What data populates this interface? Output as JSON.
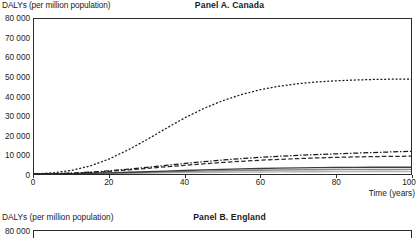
{
  "figure": {
    "axis_color": "#2b2b2b",
    "background": "#ffffff"
  },
  "panel_a": {
    "title": "Panel A. Canada",
    "y_axis_label": "DALYs (per million population)",
    "x_axis_label": "Time (years)"
  },
  "panel_b": {
    "title": "Panel B. England",
    "y_axis_label": "DALYs (per million population)",
    "y_top_tick": "80 000"
  },
  "chart_data": [
    {
      "type": "line",
      "title": "Panel A. Canada",
      "xlabel": "Time (years)",
      "ylabel": "DALYs (per million population)",
      "xlim": [
        0,
        100
      ],
      "ylim": [
        0,
        80000
      ],
      "xticks": [
        0,
        20,
        40,
        60,
        80,
        100
      ],
      "xtick_labels": [
        "0",
        "20",
        "40",
        "60",
        "80",
        "100"
      ],
      "yticks": [
        0,
        10000,
        20000,
        30000,
        40000,
        50000,
        60000,
        70000,
        80000
      ],
      "ytick_labels": [
        "0",
        "10 000",
        "20 000",
        "30 000",
        "40 000",
        "50 000",
        "60 000",
        "70 000",
        "80 000"
      ],
      "grid": false,
      "legend": "none",
      "x": [
        0,
        5,
        10,
        15,
        20,
        25,
        30,
        35,
        40,
        45,
        50,
        55,
        60,
        65,
        70,
        75,
        80,
        85,
        90,
        95,
        100
      ],
      "series": [
        {
          "name": "series-1",
          "style": "dotted",
          "color": "#1a1a1a",
          "values": [
            0,
            600,
            1900,
            4200,
            7800,
            12500,
            17800,
            23500,
            29000,
            33800,
            37800,
            41000,
            43500,
            45300,
            46600,
            47500,
            48100,
            48500,
            48800,
            48950,
            49000
          ]
        },
        {
          "name": "series-2",
          "style": "dash-dot",
          "color": "#1a1a1a",
          "values": [
            0,
            150,
            450,
            950,
            1650,
            2500,
            3450,
            4450,
            5450,
            6350,
            7200,
            7950,
            8600,
            9150,
            9650,
            10050,
            10400,
            10750,
            11050,
            11400,
            11700
          ]
        },
        {
          "name": "series-3",
          "style": "dashed",
          "color": "#2b2b2b",
          "values": [
            0,
            120,
            380,
            800,
            1400,
            2100,
            2900,
            3700,
            4500,
            5250,
            5950,
            6550,
            7100,
            7550,
            7950,
            8300,
            8600,
            8800,
            8980,
            9100,
            9200
          ]
        },
        {
          "name": "series-4",
          "style": "solid",
          "color": "#3c3c3c",
          "values": [
            0,
            60,
            180,
            360,
            600,
            880,
            1180,
            1500,
            1820,
            2120,
            2400,
            2650,
            2860,
            3040,
            3180,
            3290,
            3370,
            3430,
            3470,
            3490,
            3500
          ]
        },
        {
          "name": "series-5",
          "style": "solid",
          "color": "#8a8a8a",
          "values": [
            0,
            40,
            120,
            250,
            420,
            620,
            830,
            1050,
            1270,
            1470,
            1660,
            1820,
            1960,
            2070,
            2160,
            2230,
            2280,
            2320,
            2345,
            2360,
            2370
          ]
        },
        {
          "name": "series-6",
          "style": "solid",
          "color": "#b5b5b5",
          "values": [
            0,
            20,
            60,
            130,
            220,
            330,
            450,
            570,
            690,
            800,
            900,
            990,
            1060,
            1120,
            1165,
            1200,
            1225,
            1245,
            1258,
            1265,
            1270
          ]
        }
      ]
    },
    {
      "type": "line",
      "title": "Panel B. England",
      "ylabel": "DALYs (per million population)",
      "ylim": [
        0,
        80000
      ],
      "note": "panel cropped at bottom of screenshot"
    }
  ]
}
